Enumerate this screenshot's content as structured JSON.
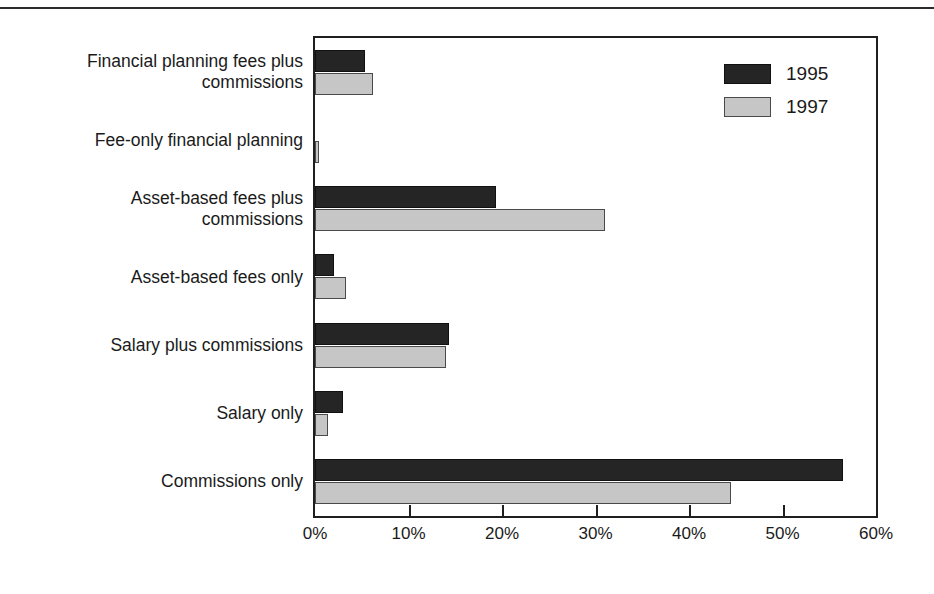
{
  "figure": {
    "name": "grouped-horizontal-bar-chart",
    "background": "#ffffff",
    "frame_color": "#1f1f1f"
  },
  "legend": {
    "position": "top-right-inside",
    "entries": [
      {
        "label": "1995",
        "color": "#252525"
      },
      {
        "label": "1997",
        "color": "#c6c6c6"
      }
    ]
  },
  "axis": {
    "x_ticks": [
      "0%",
      "10%",
      "20%",
      "30%",
      "40%",
      "50%",
      "60%"
    ]
  },
  "chart_data": {
    "type": "bar",
    "orientation": "horizontal",
    "title": "",
    "subtitle": "",
    "xlabel": "",
    "ylabel": "",
    "xlim": [
      0,
      60
    ],
    "xtick_values": [
      0,
      10,
      20,
      30,
      40,
      50,
      60
    ],
    "xtick_labels": [
      "0%",
      "10%",
      "20%",
      "30%",
      "40%",
      "50%",
      "60%"
    ],
    "grid": false,
    "legend_position": "upper right",
    "value_unit": "percent",
    "categories": [
      "Financial planning fees plus commissions",
      "Fee-only financial planning",
      "Asset-based fees plus commissions",
      "Asset-based fees only",
      "Salary plus commissions",
      "Salary only",
      "Commissions only"
    ],
    "category_lines": [
      [
        "Financial planning fees plus",
        "commissions"
      ],
      [
        "Fee-only financial planning"
      ],
      [
        "Asset-based fees plus",
        "commissions"
      ],
      [
        "Asset-based fees only"
      ],
      [
        "Salary plus commissions"
      ],
      [
        "Salary only"
      ],
      [
        "Commissions only"
      ]
    ],
    "series": [
      {
        "name": "1995",
        "color": "#252525",
        "values": [
          5.3,
          0.0,
          19.4,
          2.0,
          14.3,
          3.0,
          56.5
        ]
      },
      {
        "name": "1997",
        "color": "#c6c6c6",
        "values": [
          6.2,
          0.4,
          31.0,
          3.3,
          14.0,
          1.4,
          44.5
        ]
      }
    ]
  }
}
